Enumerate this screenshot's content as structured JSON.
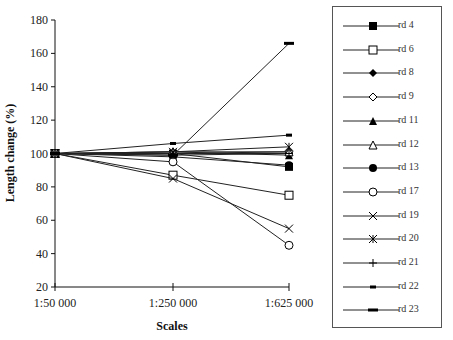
{
  "chart_data": {
    "type": "line",
    "title": "",
    "xlabel": "Scales",
    "ylabel": "Length change (%)",
    "categories": [
      "1:50 000",
      "1:250 000",
      "1:625 000"
    ],
    "ylim": [
      20,
      180
    ],
    "yticks": [
      20,
      40,
      60,
      80,
      100,
      120,
      140,
      160,
      180
    ],
    "grid": false,
    "legend_position": "right",
    "series": [
      {
        "name": "rd 4",
        "marker": "filled-square",
        "values": [
          100,
          100,
          92
        ]
      },
      {
        "name": "rd 6",
        "marker": "open-square",
        "values": [
          100,
          87,
          75
        ]
      },
      {
        "name": "rd 8",
        "marker": "filled-diamond",
        "values": [
          100,
          100,
          100
        ]
      },
      {
        "name": "rd 9",
        "marker": "open-diamond",
        "values": [
          100,
          100,
          101
        ]
      },
      {
        "name": "rd 11",
        "marker": "filled-triangle",
        "values": [
          100,
          101,
          99
        ]
      },
      {
        "name": "rd 12",
        "marker": "open-triangle",
        "values": [
          100,
          101,
          101
        ]
      },
      {
        "name": "rd 13",
        "marker": "filled-circle",
        "values": [
          100,
          98,
          93
        ]
      },
      {
        "name": "rd 17",
        "marker": "open-circle",
        "values": [
          100,
          95,
          45
        ]
      },
      {
        "name": "rd 19",
        "marker": "x",
        "values": [
          100,
          85,
          55
        ]
      },
      {
        "name": "rd 20",
        "marker": "asterisk",
        "values": [
          100,
          101,
          104
        ]
      },
      {
        "name": "rd 21",
        "marker": "plus",
        "values": [
          100,
          99,
          100
        ]
      },
      {
        "name": "rd 22",
        "marker": "short-bar",
        "values": [
          100,
          106,
          111
        ]
      },
      {
        "name": "rd 23",
        "marker": "long-bar",
        "values": [
          100,
          99,
          166
        ]
      }
    ]
  }
}
